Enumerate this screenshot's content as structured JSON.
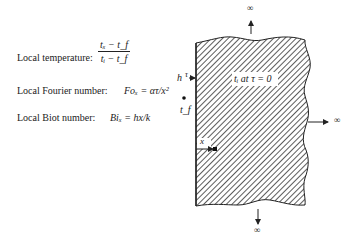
{
  "equations": {
    "local_temperature": {
      "label": "Local temperature:",
      "numerator": "tₓ − t_f",
      "denominator": "tᵢ − t_f"
    },
    "local_fourier": {
      "label": "Local Fourier number:",
      "expr": "Foₓ = ατ/x²"
    },
    "local_biot": {
      "label": "Local Biot number:",
      "expr": "Biₓ = hx/k"
    }
  },
  "diagram": {
    "solid_label": "tᵢ at τ = 0",
    "h_label": "h",
    "tau_label": "τ",
    "fluid_temp_label": "t_f",
    "x_label": "x",
    "infinity_top": "∞",
    "infinity_right": "∞",
    "infinity_bottom": "∞",
    "hatch_color": "#333333"
  }
}
